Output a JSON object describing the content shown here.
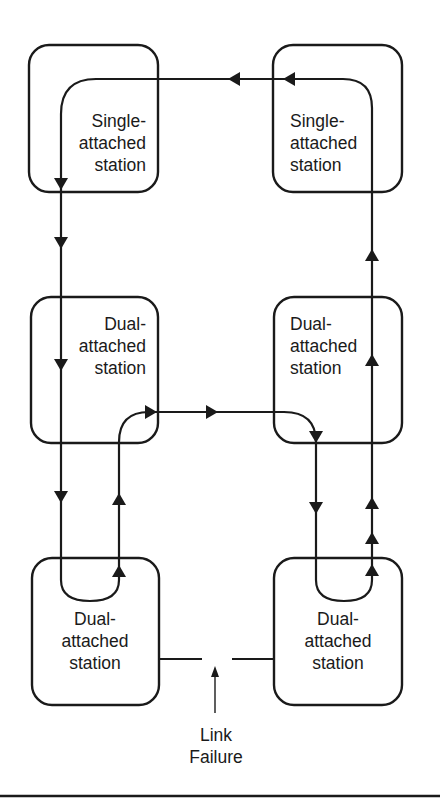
{
  "diagram": {
    "stations": [
      {
        "id": "top-left",
        "lines": [
          "Single-",
          "attached",
          "station"
        ]
      },
      {
        "id": "top-right",
        "lines": [
          "Single-",
          "attached",
          "station"
        ]
      },
      {
        "id": "middle-left",
        "lines": [
          "Dual-",
          "attached",
          "station"
        ]
      },
      {
        "id": "middle-right",
        "lines": [
          "Dual-",
          "attached",
          "station"
        ]
      },
      {
        "id": "bottom-left",
        "lines": [
          "Dual-",
          "attached",
          "station"
        ]
      },
      {
        "id": "bottom-right",
        "lines": [
          "Dual-",
          "attached",
          "station"
        ]
      }
    ],
    "failure_label": [
      "Link",
      "Failure"
    ],
    "colors": {
      "ink": "#1a1a1a",
      "background": "#ffffff"
    }
  }
}
